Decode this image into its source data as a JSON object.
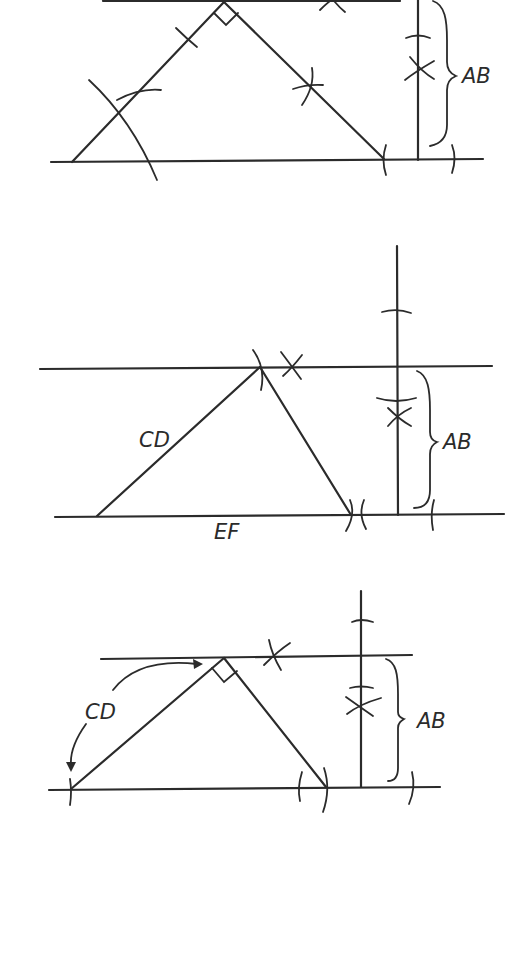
{
  "diagram": {
    "title": "",
    "stroke_color": "#2b2b2b",
    "background": "#ffffff",
    "figures": [
      {
        "id": "figure-1",
        "labels": {
          "height": "AB"
        },
        "features": [
          "right-angle-marker-at-apex",
          "arc-marks",
          "perpendicular-construction"
        ]
      },
      {
        "id": "figure-2",
        "labels": {
          "side": "CD",
          "base": "EF",
          "height": "AB"
        },
        "features": [
          "arc-marks",
          "perpendicular-construction"
        ]
      },
      {
        "id": "figure-3",
        "labels": {
          "side": "CD",
          "height": "AB"
        },
        "features": [
          "right-angle-marker-at-apex",
          "curved-arrows-transferring-CD",
          "arc-marks",
          "perpendicular-construction"
        ]
      }
    ]
  }
}
